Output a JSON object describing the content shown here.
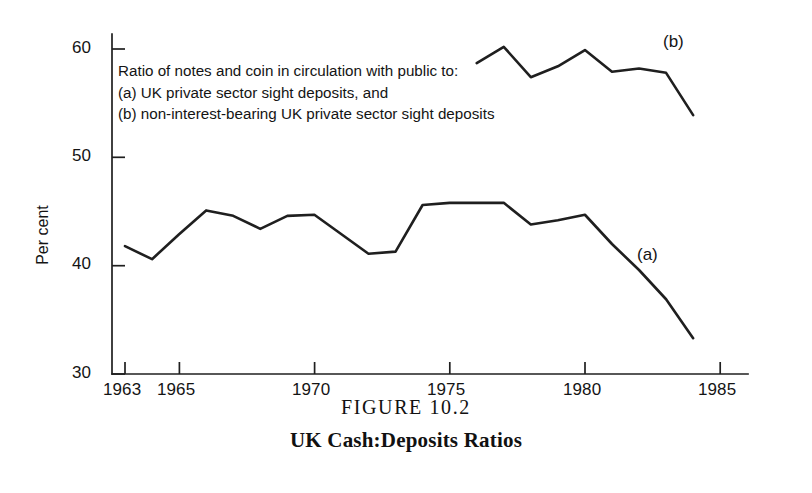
{
  "caption": {
    "figure_number": "FIGURE 10.2",
    "title": "UK Cash:Deposits Ratios"
  },
  "annotation": {
    "line1": "Ratio of notes and coin in circulation with public to:",
    "line2": "(a) UK private sector sight deposits, and",
    "line3": "(b) non-interest-bearing UK private sector sight deposits"
  },
  "series_tags": {
    "a": "(a)",
    "b": "(b)"
  },
  "chart_data": {
    "type": "line",
    "title": "UK Cash:Deposits Ratios",
    "subtitle": "FIGURE 10.2",
    "xlabel": "",
    "ylabel": "Per cent",
    "xlim": [
      1963,
      1985
    ],
    "ylim": [
      30,
      60
    ],
    "xticks": [
      1963,
      1965,
      1970,
      1975,
      1980,
      1985
    ],
    "xtick_labels": [
      "1963",
      "1965",
      "1970",
      "1975",
      "1980",
      "1985"
    ],
    "yticks": [
      30,
      40,
      50,
      60
    ],
    "ytick_labels": [
      "30",
      "40",
      "50",
      "60"
    ],
    "grid": false,
    "legend": "inline-labels",
    "line_color": "#1f1f1f",
    "series": [
      {
        "name": "(a) UK private sector sight deposits",
        "label": "(a)",
        "x": [
          1963,
          1964,
          1965,
          1966,
          1967,
          1968,
          1969,
          1970,
          1971,
          1972,
          1973,
          1974,
          1975,
          1976,
          1977,
          1978,
          1979,
          1980,
          1981,
          1982,
          1983,
          1984
        ],
        "values": [
          41.8,
          40.6,
          42.9,
          45.1,
          44.6,
          43.4,
          44.6,
          44.7,
          42.9,
          41.1,
          41.3,
          45.6,
          45.8,
          45.8,
          45.8,
          43.8,
          44.2,
          44.7,
          42.0,
          39.6,
          36.9,
          33.3
        ]
      },
      {
        "name": "(b) non-interest-bearing UK private sector sight deposits",
        "label": "(b)",
        "x": [
          1976,
          1977,
          1978,
          1979,
          1980,
          1981,
          1982,
          1983,
          1984
        ],
        "values": [
          58.7,
          60.2,
          57.4,
          58.4,
          59.9,
          57.9,
          58.2,
          57.8,
          53.9
        ]
      }
    ]
  }
}
